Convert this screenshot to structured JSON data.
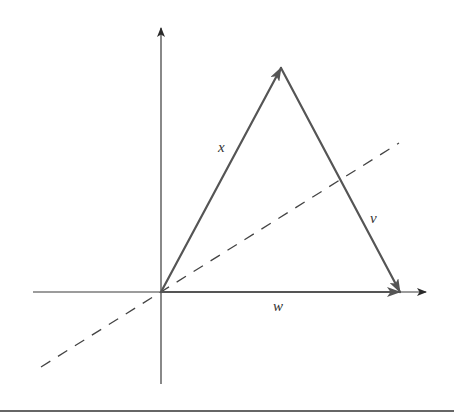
{
  "diagram": {
    "colors": {
      "axis": "#3a3a3a",
      "vector": "#555555",
      "dashed": "#444444",
      "label": "#333333",
      "background": "#ffffff"
    },
    "origin": {
      "x": 161,
      "y": 292
    },
    "axes": {
      "x_axis": {
        "from": {
          "x": 33,
          "y": 292
        },
        "to": {
          "x": 426,
          "y": 292
        }
      },
      "y_axis": {
        "from": {
          "x": 161,
          "y": 384
        },
        "to": {
          "x": 161,
          "y": 28
        }
      }
    },
    "vectors": [
      {
        "name": "x",
        "label": "x",
        "from": {
          "x": 161,
          "y": 292
        },
        "to": {
          "x": 281,
          "y": 68
        },
        "label_pos": {
          "x": 222,
          "y": 152
        }
      },
      {
        "name": "v",
        "label": "v",
        "from": {
          "x": 281,
          "y": 68
        },
        "to": {
          "x": 400,
          "y": 292
        },
        "label_pos": {
          "x": 372,
          "y": 223
        }
      },
      {
        "name": "w",
        "label": "w",
        "from": {
          "x": 161,
          "y": 292
        },
        "to": {
          "x": 400,
          "y": 292
        },
        "label_pos": {
          "x": 274,
          "y": 311
        }
      }
    ],
    "dashed_line": {
      "from": {
        "x": 41,
        "y": 367
      },
      "to": {
        "x": 399,
        "y": 143
      }
    },
    "bottom_rule": {
      "y": 411
    }
  }
}
